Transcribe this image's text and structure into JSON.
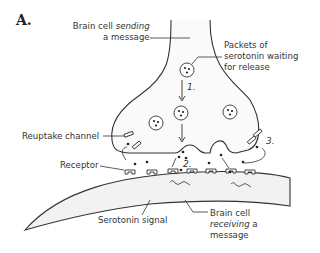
{
  "figure": {
    "panel_label": "A.",
    "labels": {
      "sending_cell_line1": "Brain cell",
      "sending_cell_italic": "sending",
      "sending_cell_line2": "a message",
      "packets_line1": "Packets of",
      "packets_line2": "serotonin waiting",
      "packets_line3": "for release",
      "reuptake_channel": "Reuptake channel",
      "receptor": "Receptor",
      "serotonin_signal": "Serotonin signal",
      "receiving_cell_line1": "Brain cell",
      "receiving_cell_italic": "receiving",
      "receiving_cell_a": "a",
      "receiving_cell_line3": "message"
    },
    "steps": [
      "1.",
      "2.",
      "3."
    ]
  }
}
